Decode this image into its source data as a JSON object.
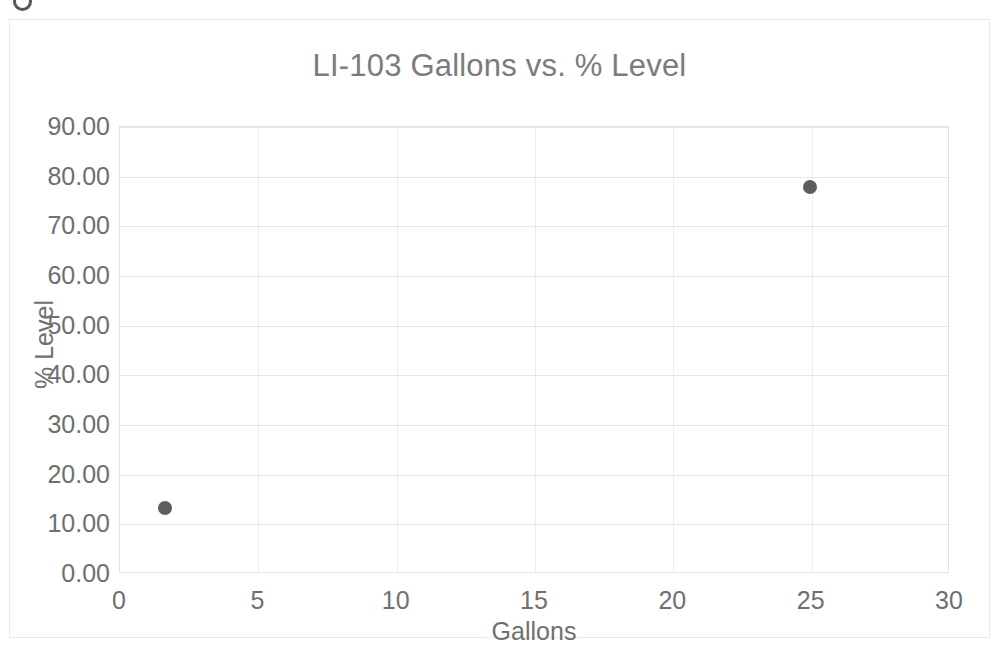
{
  "chart_data": {
    "type": "scatter",
    "title": "LI-103 Gallons vs. % Level",
    "xlabel": "Gallons",
    "ylabel": "% Level",
    "xlim": [
      0,
      30
    ],
    "ylim": [
      0,
      90
    ],
    "xticks": [
      "0",
      "5",
      "10",
      "15",
      "20",
      "25",
      "30"
    ],
    "xtick_values": [
      0,
      5,
      10,
      15,
      20,
      25,
      30
    ],
    "yticks": [
      "0.00",
      "10.00",
      "20.00",
      "30.00",
      "40.00",
      "50.00",
      "60.00",
      "70.00",
      "80.00",
      "90.00"
    ],
    "ytick_values": [
      0,
      10,
      20,
      30,
      40,
      50,
      60,
      70,
      80,
      90
    ],
    "grid": true,
    "legend": false,
    "series": [
      {
        "name": "% Level",
        "marker_color": "#5e5e5e",
        "points": [
          {
            "x": 1.63,
            "y": 13.3
          },
          {
            "x": 24.95,
            "y": 77.9
          }
        ]
      }
    ]
  },
  "style": {
    "title_color": "#7b7b7b",
    "tick_color": "#6f6f6f",
    "grid_color": "#e6e6e6",
    "plot_border_color": "#e3e3e3",
    "frame_border_color": "#e9e9e9",
    "background": "#ffffff"
  }
}
